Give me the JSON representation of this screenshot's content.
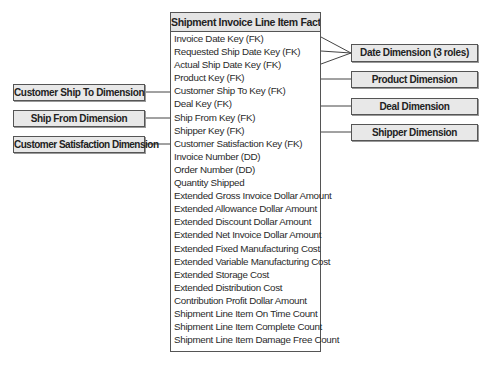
{
  "fact_table": {
    "title": "Shipment Invoice Line Item Fact",
    "attributes": [
      "Invoice Date Key (FK)",
      "Requested Ship Date Key (FK)",
      "Actual Ship Date Key (FK)",
      "Product Key (FK)",
      "Customer Ship To Key (FK)",
      "Deal Key (FK)",
      "Ship From Key (FK)",
      "Shipper Key (FK)",
      "Customer Satisfaction Key (FK)",
      "Invoice Number (DD)",
      "Order Number (DD)",
      "Quantity Shipped",
      "Extended Gross Invoice Dollar Amount",
      "Extended Allowance Dollar Amount",
      "Extended Discount Dollar Amount",
      "Extended Net Invoice Dollar Amount",
      "Extended Fixed Manufacturing Cost",
      "Extended Variable Manufacturing Cost",
      "Extended Storage Cost",
      "Extended Distribution Cost",
      "Contribution Profit Dollar Amount",
      "Shipment Line Item On Time Count",
      "Shipment Line Item Complete Count",
      "Shipment Line Item Damage Free Count"
    ]
  },
  "right_dimensions": {
    "date": "Date Dimension (3 roles)",
    "product": "Product Dimension",
    "deal": "Deal Dimension",
    "shipper": "Shipper Dimension"
  },
  "left_dimensions": {
    "customer_ship_to": "Customer Ship To Dimension",
    "ship_from": "Ship From Dimension",
    "customer_satisfaction": "Customer Satisfaction Dimension"
  },
  "colors": {
    "box_fill": "#e8e8e8",
    "border": "#555555",
    "line": "#444444"
  }
}
